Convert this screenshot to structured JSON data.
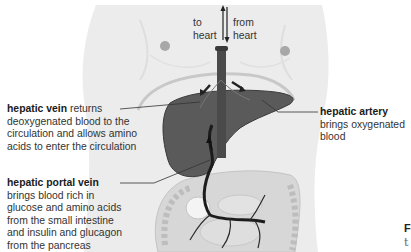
{
  "diagram": {
    "flow_labels": {
      "to_heart": [
        "to",
        "heart"
      ],
      "from_heart": [
        "from",
        "heart"
      ]
    },
    "labels": [
      {
        "id": "hepatic-vein",
        "term": "hepatic vein",
        "desc_inline": "returns",
        "desc_lines": [
          "deoxygenated blood to the",
          "circulation and allows amino",
          "acids to enter the circulation"
        ]
      },
      {
        "id": "hepatic-artery",
        "term": "hepatic artery",
        "desc_lines": [
          "brings oxygenated",
          "blood"
        ]
      },
      {
        "id": "hepatic-portal-vein",
        "term": "hepatic portal vein",
        "desc_lines": [
          "brings blood rich in",
          "glucose and amino acids",
          "from the small intestine",
          "and insulin and glucagon",
          "from the pancreas"
        ]
      }
    ],
    "cut_off_text": {
      "line1": "F",
      "line2": "t"
    },
    "colors": {
      "body": "#ececec",
      "body_outline": "#dcdcdc",
      "liver": "#555555",
      "vessel": "#444444",
      "portal_vein": "#1f1f1f",
      "intestine": "#cfcfcf",
      "nipple": "#9a9a9a",
      "leader_line": "#333333"
    }
  }
}
